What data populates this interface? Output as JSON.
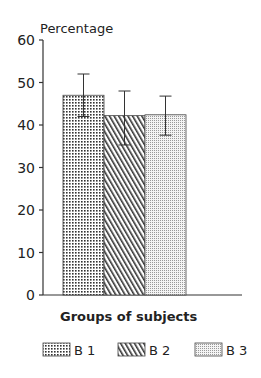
{
  "chart_data": {
    "type": "bar",
    "title": "",
    "ylabel": "Percentage",
    "xlabel": "Groups of subjects",
    "ylim": [
      0,
      60
    ],
    "yticks": [
      0,
      10,
      20,
      30,
      40,
      50,
      60
    ],
    "grid": false,
    "legend_position": "bottom",
    "categories": [
      "B 1",
      "B 2",
      "B 3"
    ],
    "values": [
      47,
      42.2,
      42.4
    ],
    "error_bars": [
      {
        "upper": 52,
        "lower": 42
      },
      {
        "upper": 48,
        "lower": 35.3
      },
      {
        "upper": 46.8,
        "lower": 37.6
      }
    ],
    "patterns": [
      "dots-grid",
      "diagonal-hatch",
      "fine-stipple"
    ]
  },
  "legend": {
    "items": [
      {
        "label": "B 1",
        "pattern": "dots-grid"
      },
      {
        "label": "B 2",
        "pattern": "diagonal-hatch"
      },
      {
        "label": "B 3",
        "pattern": "fine-stipple"
      }
    ]
  },
  "axis": {
    "ylabel": "Percentage",
    "xlabel": "Groups of subjects",
    "ticks": [
      "0",
      "10",
      "20",
      "30",
      "40",
      "50",
      "60"
    ]
  }
}
